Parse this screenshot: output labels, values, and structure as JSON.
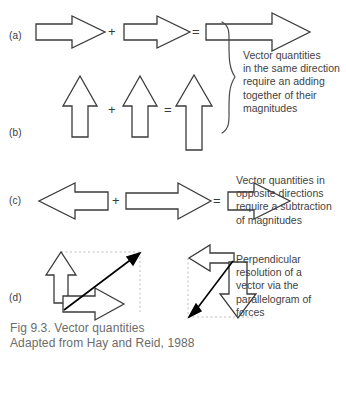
{
  "figure": {
    "caption_line1": "Fig 9.3. Vector quantities",
    "caption_line2": "Adapted from Hay and Reid, 1988",
    "caption_full": "Fig 9.3. Vector quantities\nAdapted from Hay and Reid, 1988"
  },
  "rows": {
    "a": {
      "label": "(a)"
    },
    "b": {
      "label": "(b)"
    },
    "c": {
      "label": "(c)"
    },
    "d": {
      "label": "(d)"
    }
  },
  "operators": {
    "plus": "+",
    "equals": "="
  },
  "descriptions": {
    "same_direction": "Vector quantities\nin the same direction\nrequire an adding\ntogether of their\nmagnitudes",
    "opposite_direction": "Vector quantities in\nopposite directions\nrequire a subtraction\nof magnitudes",
    "perpendicular": "Perpendicular\nresolution of a\nvector via the\nparallelogram of\nforces"
  },
  "colors": {
    "stroke": "#3a3a3a",
    "fill": "#ffffff",
    "solid_arrow": "#000000",
    "dashed_guide": "#b9b9b9",
    "text": "#3f3f3f",
    "caption_text": "#6b6b6b",
    "background": "#ffffff"
  },
  "icons": {
    "brace": "curly-brace-icon",
    "arrow_right": "block-arrow-right-icon",
    "arrow_left": "block-arrow-left-icon",
    "arrow_up": "block-arrow-up-icon",
    "arrow_down": "block-arrow-down-icon",
    "resultant": "solid-resultant-arrow-icon"
  }
}
